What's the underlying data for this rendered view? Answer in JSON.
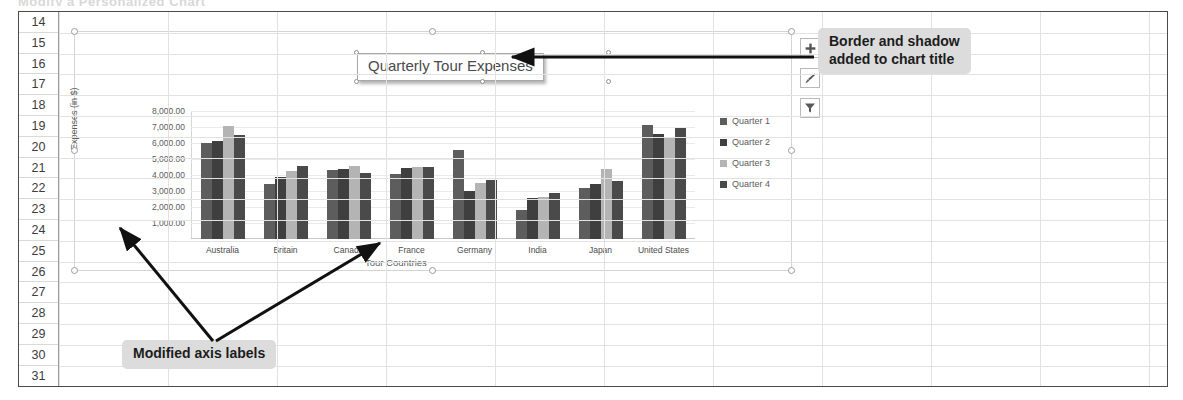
{
  "top_clip_text": "Modify a Personalized Chart",
  "worksheet": {
    "row_headers": [
      "14",
      "15",
      "16",
      "17",
      "18",
      "19",
      "20",
      "21",
      "22",
      "23",
      "24",
      "25",
      "26",
      "27",
      "28",
      "29",
      "30",
      "31"
    ]
  },
  "chart": {
    "title": "Quarterly Tour Expenses",
    "buttons": [
      {
        "name": "chart-elements-button",
        "glyph": "+"
      },
      {
        "name": "chart-styles-button",
        "glyph": "brush"
      },
      {
        "name": "chart-filters-button",
        "glyph": "funnel"
      }
    ]
  },
  "annotations": [
    {
      "id": "callout-title",
      "text": "Border and shadow\nadded to chart title"
    },
    {
      "id": "callout-axis",
      "text": "Modified axis labels"
    }
  ],
  "chart_data": {
    "type": "bar",
    "title": "Quarterly Tour Expenses",
    "xlabel": "Tour Countries",
    "ylabel": "Expenses (in $)",
    "ylim": [
      0,
      8000
    ],
    "yticks": [
      1000,
      2000,
      3000,
      4000,
      5000,
      6000,
      7000,
      8000
    ],
    "ytick_labels": [
      "1,000.00",
      "2,000.00",
      "3,000.00",
      "4,000.00",
      "5,000.00",
      "6,000.00",
      "7,000.00",
      "8,000.00"
    ],
    "grid": true,
    "legend_position": "right",
    "categories": [
      "Australia",
      "Britain",
      "Canada",
      "France",
      "Germany",
      "India",
      "Japan",
      "United States"
    ],
    "series": [
      {
        "name": "Quarter 1",
        "color": "#5d5d5d",
        "values": [
          6000,
          3450,
          4300,
          4050,
          5550,
          1800,
          3200,
          7100
        ]
      },
      {
        "name": "Quarter 2",
        "color": "#3f3f3f",
        "values": [
          6100,
          3900,
          4350,
          4450,
          3000,
          2550,
          3450,
          6550
        ]
      },
      {
        "name": "Quarter 3",
        "color": "#b4b4b4",
        "values": [
          7050,
          4250,
          4550,
          4500,
          3500,
          2650,
          4400,
          6300
        ]
      },
      {
        "name": "Quarter 4",
        "color": "#4a4a4a",
        "values": [
          6500,
          4550,
          4100,
          4500,
          3700,
          2900,
          3650,
          6950
        ]
      }
    ]
  }
}
